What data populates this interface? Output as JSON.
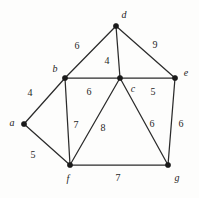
{
  "figure": {
    "background_color": "#fdfdfc",
    "edge_color": "#2b2b2b",
    "vertex_color": "#1a1a1a"
  },
  "chart_data": {
    "type": "diagram",
    "title": "",
    "xlabel": "",
    "ylabel": "",
    "layout": {
      "width": 199,
      "height": 198,
      "grid": false,
      "legend": "none"
    },
    "nodes": [
      {
        "id": "a",
        "label": "a",
        "x": 24,
        "y": 124,
        "label_x": 12,
        "label_y": 123
      },
      {
        "id": "b",
        "label": "b",
        "x": 65,
        "y": 78,
        "label_x": 55,
        "label_y": 69
      },
      {
        "id": "c",
        "label": "c",
        "x": 120,
        "y": 78,
        "label_x": 133,
        "label_y": 89
      },
      {
        "id": "d",
        "label": "d",
        "x": 116,
        "y": 26,
        "label_x": 124,
        "label_y": 15
      },
      {
        "id": "e",
        "label": "e",
        "x": 175,
        "y": 78,
        "label_x": 186,
        "label_y": 73
      },
      {
        "id": "f",
        "label": "f",
        "x": 70,
        "y": 165,
        "label_x": 68,
        "label_y": 179
      },
      {
        "id": "g",
        "label": "g",
        "x": 168,
        "y": 165,
        "label_x": 177,
        "label_y": 178
      }
    ],
    "edges": [
      {
        "source": "a",
        "target": "b",
        "weight": 4,
        "label_x": 30,
        "label_y": 93
      },
      {
        "source": "a",
        "target": "f",
        "weight": 5,
        "label_x": 33,
        "label_y": 155
      },
      {
        "source": "b",
        "target": "d",
        "weight": 6,
        "label_x": 77,
        "label_y": 46
      },
      {
        "source": "b",
        "target": "c",
        "weight": 6,
        "label_x": 89,
        "label_y": 92
      },
      {
        "source": "b",
        "target": "f",
        "weight": 7,
        "label_x": 76,
        "label_y": 125
      },
      {
        "source": "d",
        "target": "c",
        "weight": 4,
        "label_x": 107,
        "label_y": 61
      },
      {
        "source": "d",
        "target": "e",
        "weight": 9,
        "label_x": 155,
        "label_y": 45
      },
      {
        "source": "c",
        "target": "e",
        "weight": 5,
        "label_x": 153,
        "label_y": 92
      },
      {
        "source": "c",
        "target": "f",
        "weight": 8,
        "label_x": 103,
        "label_y": 128
      },
      {
        "source": "c",
        "target": "g",
        "weight": 6,
        "label_x": 152,
        "label_y": 124
      },
      {
        "source": "e",
        "target": "g",
        "weight": 6,
        "label_x": 181,
        "label_y": 124
      },
      {
        "source": "f",
        "target": "g",
        "weight": 7,
        "label_x": 118,
        "label_y": 178
      }
    ]
  }
}
